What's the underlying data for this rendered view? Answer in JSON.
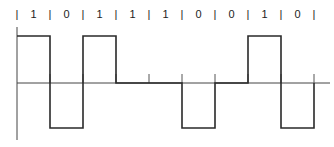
{
  "diagram": {
    "type": "line-coding-waveform",
    "encoding_levels": [
      "+",
      "0",
      "-"
    ],
    "bits": [
      "1",
      "0",
      "1",
      "1",
      "1",
      "0",
      "0",
      "1",
      "0"
    ],
    "levels": [
      1,
      -1,
      1,
      0,
      0,
      -1,
      0,
      1,
      -1
    ],
    "separator_glyph": "|",
    "colors": {
      "line": "#2a2a2a",
      "text": "#222222",
      "background": "#ffffff"
    }
  }
}
